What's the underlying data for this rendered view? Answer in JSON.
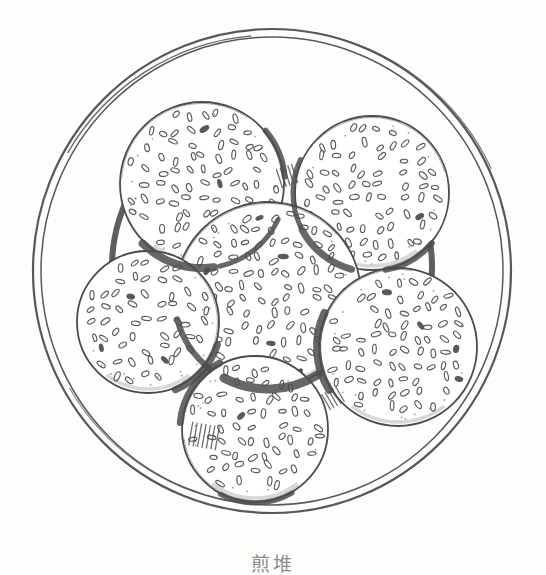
{
  "meta": {
    "caption": "煎堆",
    "caption_color": "#8c8c8c",
    "ink_color": "#4c4c4c",
    "rim_color": "#585858",
    "paper_color": "#fdfdfb"
  },
  "illustration": {
    "canvas": {
      "width": 546,
      "height": 568
    },
    "plate": {
      "cx": 272,
      "cy": 271,
      "outer_rx": 239,
      "outer_ry": 242,
      "inner_rx": 231,
      "inner_ry": 234,
      "sketch_arcs": [
        {
          "r": 236,
          "a0": -150,
          "a1": -95,
          "w": 1.4,
          "o": 0.9
        },
        {
          "r": 242,
          "a0": -80,
          "a1": -25,
          "w": 1.2,
          "o": 0.8
        },
        {
          "r": 234,
          "a0": 100,
          "a1": 150,
          "w": 1.2,
          "o": 0.7
        }
      ],
      "well": {
        "cx": 272,
        "cy": 267,
        "r": 160,
        "arcs": [
          {
            "a0": 172,
            "a1": 222,
            "w": 6
          },
          {
            "a0": -35,
            "a1": 14,
            "w": 6
          }
        ]
      }
    },
    "balls": [
      {
        "cx": 202,
        "cy": 184,
        "r": 82,
        "rng_seed": 11
      },
      {
        "cx": 372,
        "cy": 193,
        "r": 77,
        "rng_seed": 22
      },
      {
        "cx": 268,
        "cy": 295,
        "r": 93,
        "rng_seed": 33
      },
      {
        "cx": 148,
        "cy": 322,
        "r": 71,
        "rng_seed": 44
      },
      {
        "cx": 398,
        "cy": 347,
        "r": 79,
        "rng_seed": 55
      },
      {
        "cx": 255,
        "cy": 429,
        "r": 73,
        "rng_seed": 66
      }
    ],
    "shadows": [
      {
        "cx": 202,
        "cy": 184,
        "r": 84,
        "a0": 25,
        "a1": 78,
        "w": 5
      },
      {
        "cx": 202,
        "cy": 184,
        "r": 84,
        "a0": 82,
        "a1": 135,
        "w": 8
      },
      {
        "cx": 202,
        "cy": 184,
        "r": 83,
        "a0": -40,
        "a1": -5,
        "w": 6
      },
      {
        "cx": 372,
        "cy": 193,
        "r": 79,
        "a0": 105,
        "a1": 152,
        "w": 7
      },
      {
        "cx": 372,
        "cy": 193,
        "r": 79,
        "a0": 155,
        "a1": 205,
        "w": 5
      },
      {
        "cx": 372,
        "cy": 193,
        "r": 78,
        "a0": 40,
        "a1": 80,
        "w": 6
      },
      {
        "cx": 268,
        "cy": 295,
        "r": 94,
        "a0": 58,
        "a1": 118,
        "w": 9
      },
      {
        "cx": 268,
        "cy": 295,
        "r": 94,
        "a0": 128,
        "a1": 165,
        "w": 6
      },
      {
        "cx": 148,
        "cy": 322,
        "r": 73,
        "a0": 18,
        "a1": 68,
        "w": 7
      },
      {
        "cx": 398,
        "cy": 347,
        "r": 81,
        "a0": 148,
        "a1": 205,
        "w": 8
      },
      {
        "cx": 255,
        "cy": 429,
        "r": 75,
        "a0": 185,
        "a1": 242,
        "w": 7
      },
      {
        "cx": 255,
        "cy": 429,
        "r": 74,
        "a0": 60,
        "a1": 118,
        "w": 5
      }
    ],
    "hatches": [
      {
        "x": 204,
        "y": 436,
        "angle": 100,
        "len": 24,
        "count": 7,
        "spacing": 4.5
      },
      {
        "x": 287,
        "y": 176,
        "angle": 72,
        "len": 20,
        "count": 5,
        "spacing": 4
      },
      {
        "x": 333,
        "y": 398,
        "angle": 60,
        "len": 18,
        "count": 5,
        "spacing": 4
      }
    ],
    "seed_style": {
      "grid_step": 14,
      "rx_min": 3.6,
      "rx_var": 1.4,
      "ry_min": 1.8,
      "ry_var": 0.7,
      "skip_prob": 0.1,
      "dark_prob": 0.045,
      "stipple_per_ball": 18
    }
  }
}
